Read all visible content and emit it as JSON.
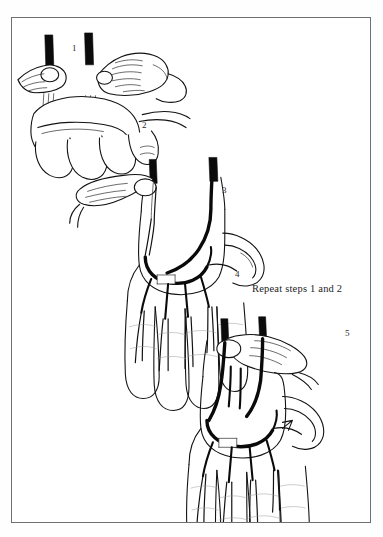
{
  "page_header": {
    "folio": "",
    "running_head": ""
  },
  "figure": {
    "frame_color": "#6f6f74",
    "background": "#ffffff",
    "ink_color": "#111111",
    "caption_note": "Repeat steps 1 and 2",
    "step_labels": [
      {
        "id": "1",
        "text": "1",
        "x": 60,
        "y": 26
      },
      {
        "id": "2",
        "text": "2",
        "x": 130,
        "y": 103
      },
      {
        "id": "3",
        "text": "3",
        "x": 210,
        "y": 168
      },
      {
        "id": "4",
        "text": "4",
        "x": 223,
        "y": 252
      },
      {
        "id": "5",
        "text": "5",
        "x": 333,
        "y": 311
      }
    ],
    "caption_note_pos": {
      "x": 240,
      "y": 270
    },
    "panels": [
      {
        "name": "panel-compression",
        "description": "Two hands, thumbs compressing radial and ulnar arteries at the wrist; dark bars mark the occluded vessels",
        "steps": [
          "1",
          "2"
        ]
      },
      {
        "name": "panel-palmar-arch",
        "description": "Open palm with superficial palmar arch and digital arteries, one thumb still compressing",
        "steps": [
          "3",
          "4"
        ]
      },
      {
        "name": "panel-release",
        "description": "Open palm with thumb releasing one artery, refill of the palmar arch and digits",
        "steps": [
          "5"
        ]
      }
    ]
  }
}
